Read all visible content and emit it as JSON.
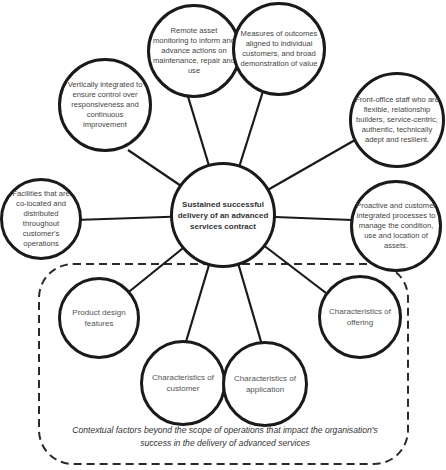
{
  "diagram": {
    "center": {
      "label": "Sustained successful delivery of an advanced services contract"
    },
    "operational_factors": [
      {
        "label": "Remote asset monitoring to inform and advance actions on maintenance, repair and use"
      },
      {
        "label": "Measures of outcomes aligned to individual customers, and broad demonstration of value"
      },
      {
        "label": "Vertically integrated to ensure control over responsiveness and continuous improvement"
      },
      {
        "label": "Front-office staff who are flexible, relationship builders, service-centric, authentic, technically adept and resilient."
      },
      {
        "label": "Facilities that are co-located and distributed throughout customer's operations"
      },
      {
        "label": "Proactive and customer integrated processes to manage the condition, use and location of assets."
      }
    ],
    "contextual_factors": [
      {
        "label": "Product design features"
      },
      {
        "label": "Characteristics of customer"
      },
      {
        "label": "Characteristics of application"
      },
      {
        "label": "Characteristics of offering"
      }
    ],
    "contextual_caption": "Contextual factors beyond the scope of operations that impact the organisation's success in the delivery of advanced services",
    "colors": {
      "stroke": "#1a1a1a",
      "text": "#444444",
      "background": "#ffffff"
    }
  }
}
